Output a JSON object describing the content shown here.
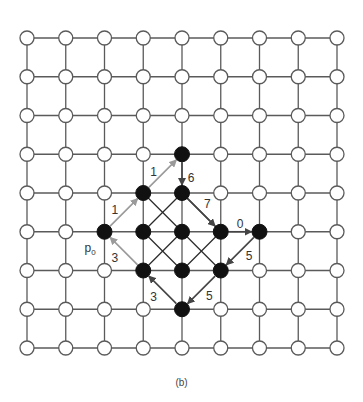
{
  "caption": "(b)",
  "grid": {
    "cols": 9,
    "rows": 9,
    "origin_x": 27,
    "origin_y": 38,
    "spacing": 38.75,
    "node_radius": 7,
    "line_color": "#5a5a5a"
  },
  "start_label": {
    "text": "p",
    "subscript": "0",
    "col": 2,
    "row": 5
  },
  "black_nodes": [
    {
      "col": 4,
      "row": 3
    },
    {
      "col": 3,
      "row": 4
    },
    {
      "col": 4,
      "row": 4
    },
    {
      "col": 2,
      "row": 5
    },
    {
      "col": 3,
      "row": 5
    },
    {
      "col": 4,
      "row": 5
    },
    {
      "col": 5,
      "row": 5
    },
    {
      "col": 6,
      "row": 5
    },
    {
      "col": 3,
      "row": 6
    },
    {
      "col": 4,
      "row": 6
    },
    {
      "col": 5,
      "row": 6
    },
    {
      "col": 4,
      "row": 7
    }
  ],
  "inner_diagonals": [
    [
      [
        3,
        4
      ],
      [
        5,
        6
      ]
    ],
    [
      [
        4,
        4
      ],
      [
        3,
        5
      ]
    ],
    [
      [
        3,
        5
      ],
      [
        4,
        6
      ]
    ],
    [
      [
        4,
        5
      ],
      [
        3,
        6
      ]
    ],
    [
      [
        5,
        5
      ],
      [
        4,
        6
      ]
    ],
    [
      [
        4,
        4
      ],
      [
        5,
        5
      ]
    ]
  ],
  "arrows": [
    {
      "from": [
        2,
        5
      ],
      "to": [
        3,
        4
      ],
      "label": "1",
      "color": "#9a9a9a",
      "lx": -9,
      "ly": -2
    },
    {
      "from": [
        3,
        4
      ],
      "to": [
        4,
        3
      ],
      "label": "1",
      "color": "#9a9a9a",
      "lx": -9,
      "ly": -2
    },
    {
      "from": [
        4,
        3
      ],
      "to": [
        4,
        4
      ],
      "label": "6",
      "color": "#444444",
      "lx": 9,
      "ly": 4
    },
    {
      "from": [
        4,
        4
      ],
      "to": [
        5,
        5
      ],
      "label": "7",
      "color": "#444444",
      "lx": 6,
      "ly": -8
    },
    {
      "from": [
        5,
        5
      ],
      "to": [
        6,
        5
      ],
      "label": "0",
      "color": "#444444",
      "lx": 0,
      "ly": -8
    },
    {
      "from": [
        6,
        5
      ],
      "to": [
        5,
        6
      ],
      "label": "5",
      "color": "#444444",
      "lx": 9,
      "ly": 5
    },
    {
      "from": [
        5,
        6
      ],
      "to": [
        4,
        7
      ],
      "label": "5",
      "color": "#444444",
      "lx": 8,
      "ly": 6
    },
    {
      "from": [
        4,
        7
      ],
      "to": [
        3,
        6
      ],
      "label": "3",
      "color": "#444444",
      "lx": -9,
      "ly": 7
    },
    {
      "from": [
        3,
        6
      ],
      "to": [
        2,
        5
      ],
      "label": "3",
      "color": "#9a9a9a",
      "lx": -9,
      "ly": 7
    }
  ]
}
